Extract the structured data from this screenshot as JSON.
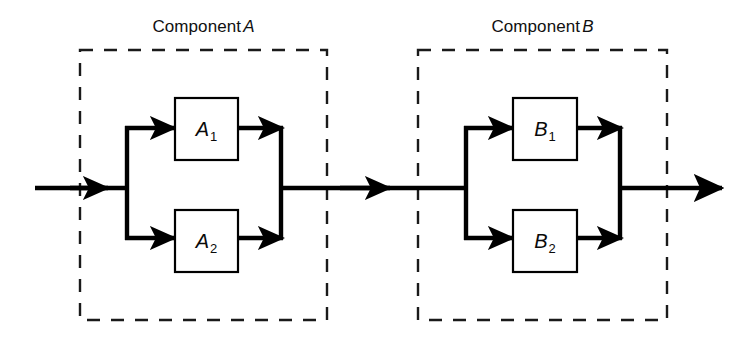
{
  "diagram": {
    "background_color": "#ffffff",
    "line_color": "#000000",
    "dashed_color": "#1a1a1a",
    "groups": [
      {
        "id": "component-a",
        "label_prefix": "Component",
        "label_id": "A",
        "boundary_style": "dashed"
      },
      {
        "id": "component-b",
        "label_prefix": "Component",
        "label_id": "B",
        "boundary_style": "dashed"
      }
    ],
    "blocks": [
      {
        "id": "block-a1",
        "letter": "A",
        "subscript": "1"
      },
      {
        "id": "block-a2",
        "letter": "A",
        "subscript": "2"
      },
      {
        "id": "block-b1",
        "letter": "B",
        "subscript": "1"
      },
      {
        "id": "block-b2",
        "letter": "B",
        "subscript": "2"
      }
    ],
    "flow": {
      "input_label": "",
      "output_label": "",
      "direction": "left-to-right"
    }
  }
}
